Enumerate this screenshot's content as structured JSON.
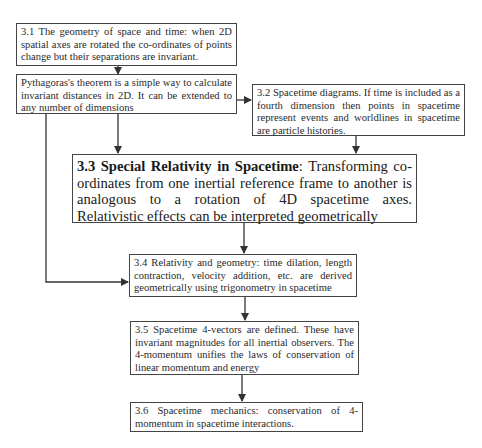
{
  "diagram": {
    "type": "flowchart",
    "boxes": [
      {
        "id": "3.1",
        "text": "3.1 The geometry of space and time: when 2D spatial axes are rotated the co-ordinates of points change but their separations are invariant."
      },
      {
        "id": "pythagoras",
        "text": "Pythagoras's theorem is a simple way to calculate invariant distances in 2D. It can be extended to any number of dimensions"
      },
      {
        "id": "3.2",
        "text": "3.2 Spacetime diagrams. If time is included as a fourth dimension then points in spacetime represent events and worldlines in spacetime are particle histories."
      },
      {
        "id": "3.3",
        "title": "3.3 Special Relativity in Spacetime",
        "text": ": Transforming co-ordinates from one inertial reference frame to another is analogous to a rotation of 4D spacetime axes. Relativistic effects can be interpreted geometrically"
      },
      {
        "id": "3.4",
        "text": "3.4 Relativity and geometry: time dilation, length contraction, velocity addition, etc. are derived geometrically using trigonometry in spacetime"
      },
      {
        "id": "3.5",
        "text": "3.5 Spacetime 4-vectors are defined. These have invariant magnitudes for all inertial observers. The 4-momentum unifies the laws of conservation of linear momentum and energy"
      },
      {
        "id": "3.6",
        "text": "3.6 Spacetime mechanics: conservation of 4-momentum in spacetime interactions."
      }
    ],
    "edges": [
      {
        "from": "3.1",
        "to": "pythagoras"
      },
      {
        "from": "pythagoras",
        "to": "3.2"
      },
      {
        "from": "pythagoras",
        "to": "3.3"
      },
      {
        "from": "pythagoras",
        "to": "3.4"
      },
      {
        "from": "3.2",
        "to": "3.3"
      },
      {
        "from": "3.3",
        "to": "3.4"
      },
      {
        "from": "3.4",
        "to": "3.5"
      },
      {
        "from": "3.5",
        "to": "3.6"
      }
    ],
    "colors": {
      "line": "#333333",
      "border": "#444444",
      "background": "#ffffff"
    }
  }
}
